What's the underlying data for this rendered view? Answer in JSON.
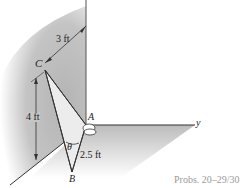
{
  "figure": {
    "labels": {
      "point_c": "C",
      "point_a": "A",
      "point_b": "B",
      "axis_y": "y",
      "angle": "θ",
      "dim_horizontal": "3 ft",
      "dim_vertical": "4 ft",
      "dim_ab": "2.5 ft"
    },
    "caption": "Probs. 20–29/30",
    "colors": {
      "wall": "#bdbdbd",
      "floor": "#c8c8c8",
      "plate": "#e6e6e6",
      "line": "#333333",
      "caption": "#9a9a9a"
    }
  }
}
